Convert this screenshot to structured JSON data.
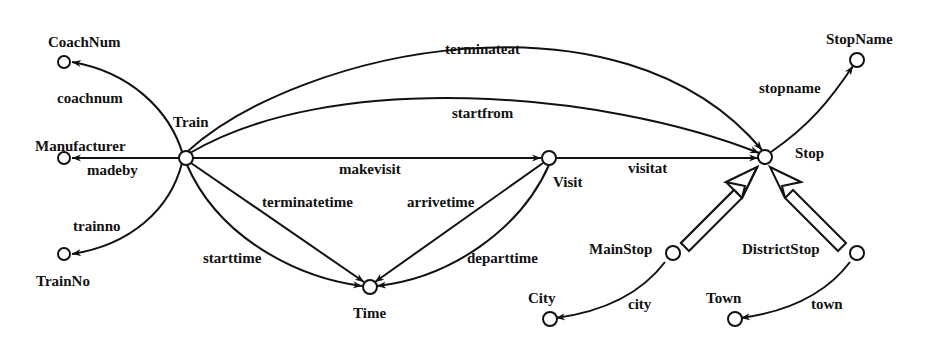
{
  "diagram": {
    "type": "schema-graph",
    "colors": {
      "stroke": "#111111",
      "background": "#ffffff"
    },
    "nodes": {
      "coachnum": "CoachNum",
      "manufacturer": "Manufacturer",
      "trainno": "TrainNo",
      "train": "Train",
      "time": "Time",
      "visit": "Visit",
      "stop": "Stop",
      "stopname": "StopName",
      "mainstop": "MainStop",
      "districtstop": "DistrictStop",
      "city": "City",
      "town": "Town"
    },
    "edges": {
      "coachnum": "coachnum",
      "madeby": "madeby",
      "trainno": "trainno",
      "terminateat": "terminateat",
      "startfrom": "startfrom",
      "makevisit": "makevisit",
      "visitat": "visitat",
      "terminatetime": "terminatetime",
      "starttime": "starttime",
      "arrivetime": "arrivetime",
      "departtime": "departtime",
      "stopname": "stopname",
      "city": "city",
      "town": "town"
    },
    "relations": [
      {
        "from": "Train",
        "to": "CoachNum",
        "label": "coachnum"
      },
      {
        "from": "Train",
        "to": "Manufacturer",
        "label": "madeby"
      },
      {
        "from": "Train",
        "to": "TrainNo",
        "label": "trainno"
      },
      {
        "from": "Train",
        "to": "Stop",
        "label": "terminateat"
      },
      {
        "from": "Train",
        "to": "Stop",
        "label": "startfrom"
      },
      {
        "from": "Train",
        "to": "Visit",
        "label": "makevisit"
      },
      {
        "from": "Visit",
        "to": "Stop",
        "label": "visitat"
      },
      {
        "from": "Train",
        "to": "Time",
        "label": "terminatetime"
      },
      {
        "from": "Train",
        "to": "Time",
        "label": "starttime"
      },
      {
        "from": "Visit",
        "to": "Time",
        "label": "arrivetime"
      },
      {
        "from": "Visit",
        "to": "Time",
        "label": "departtime"
      },
      {
        "from": "Stop",
        "to": "StopName",
        "label": "stopname"
      },
      {
        "from": "MainStop",
        "to": "City",
        "label": "city"
      },
      {
        "from": "DistrictStop",
        "to": "Town",
        "label": "town"
      },
      {
        "from": "MainStop",
        "to": "Stop",
        "label": "isa"
      },
      {
        "from": "DistrictStop",
        "to": "Stop",
        "label": "isa"
      }
    ]
  }
}
